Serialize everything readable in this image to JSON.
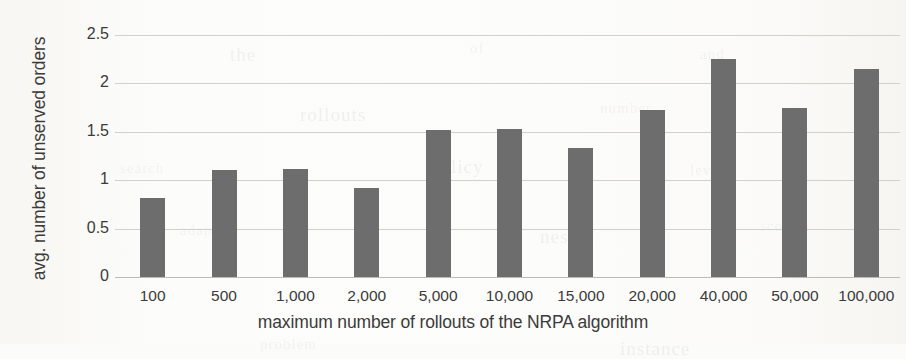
{
  "chart_data": {
    "type": "bar",
    "title": "",
    "xlabel": "maximum number of rollouts of the NRPA algorithm",
    "ylabel": "avg. number of unserved orders",
    "categories": [
      "100",
      "500",
      "1,000",
      "2,000",
      "5,000",
      "10,000",
      "15,000",
      "20,000",
      "40,000",
      "50,000",
      "100,000"
    ],
    "values": [
      0.82,
      1.11,
      1.12,
      0.92,
      1.52,
      1.53,
      1.33,
      1.73,
      2.25,
      1.75,
      2.15
    ],
    "ylim": [
      0,
      2.5
    ],
    "yticks": [
      "0",
      "0.5",
      "1",
      "1.5",
      "2",
      "2.5"
    ],
    "ytick_values": [
      0,
      0.5,
      1,
      1.5,
      2,
      2.5
    ],
    "grid": true,
    "legend": "none",
    "bar_color": "#6d6d6d",
    "gridline_color": "#d2d0ca",
    "background_color": "#fcfcfa"
  },
  "scan_artifacts": [
    {
      "text": "the",
      "x": 230,
      "y": 44
    },
    {
      "text": "of",
      "x": 470,
      "y": 40
    },
    {
      "text": "and",
      "x": 700,
      "y": 46
    },
    {
      "text": "rollouts",
      "x": 300,
      "y": 104
    },
    {
      "text": "number",
      "x": 600,
      "y": 100
    },
    {
      "text": "search",
      "x": 120,
      "y": 160
    },
    {
      "text": "policy",
      "x": 430,
      "y": 156
    },
    {
      "text": "level",
      "x": 690,
      "y": 162
    },
    {
      "text": "adapt",
      "x": 180,
      "y": 222
    },
    {
      "text": "nested",
      "x": 540,
      "y": 226
    },
    {
      "text": "score",
      "x": 760,
      "y": 218
    },
    {
      "text": "problem",
      "x": 260,
      "y": 336
    },
    {
      "text": "instance",
      "x": 620,
      "y": 338
    }
  ]
}
